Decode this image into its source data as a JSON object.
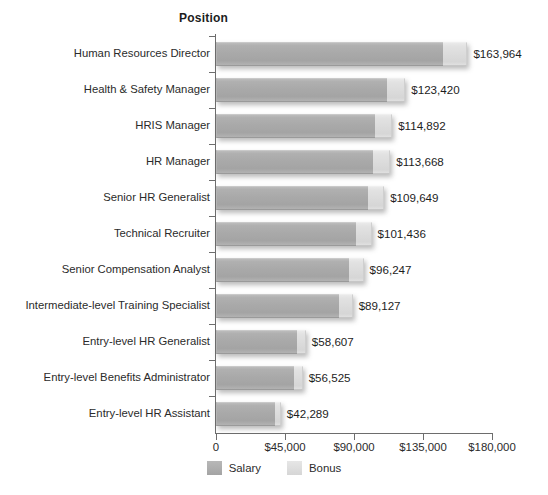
{
  "axis_title": "Position",
  "legend": {
    "position": "bottom",
    "entries": [
      {
        "label": "Salary",
        "color": "#a9a9a9",
        "swatch": "salary"
      },
      {
        "label": "Bonus",
        "color": "#dcdcdc",
        "swatch": "bonus"
      }
    ]
  },
  "x_axis": {
    "ticks": [
      {
        "label": "0",
        "value": 0
      },
      {
        "label": "$45,000",
        "value": 45000
      },
      {
        "label": "$90,000",
        "value": 90000
      },
      {
        "label": "$135,000",
        "value": 135000
      },
      {
        "label": "$180,000",
        "value": 180000
      }
    ],
    "min": 0,
    "max": 180000
  },
  "chart_data": {
    "type": "bar",
    "orientation": "horizontal",
    "stacked": true,
    "title": "",
    "subtitle": "",
    "xlabel": "",
    "ylabel": "Position",
    "xlim": [
      0,
      180000
    ],
    "grid": false,
    "legend_position": "bottom",
    "categories": [
      "Human Resources Director",
      "Health & Safety Manager",
      "HRIS Manager",
      "HR Manager",
      "Senior HR Generalist",
      "Technical Recruiter",
      "Senior Compensation Analyst",
      "Intermediate-level Training Specialist",
      "Entry-level HR Generalist",
      "Entry-level Benefits Administrator",
      "Entry-level HR Assistant"
    ],
    "series": [
      {
        "name": "Salary",
        "color": "#a9a9a9",
        "values": [
          148000,
          111500,
          103800,
          102700,
          99100,
          91600,
          86900,
          80500,
          52900,
          51000,
          38200
        ]
      },
      {
        "name": "Bonus",
        "color": "#dcdcdc",
        "values": [
          15964,
          11920,
          11092,
          10968,
          10549,
          9836,
          9347,
          8627,
          5707,
          5525,
          4089
        ]
      }
    ],
    "totals": [
      163964,
      123420,
      114892,
      113668,
      109649,
      101436,
      96247,
      89127,
      58607,
      56525,
      42289
    ],
    "data_labels": [
      "$163,964",
      "$123,420",
      "$114,892",
      "$113,668",
      "$109,649",
      "$101,436",
      "$96,247",
      "$89,127",
      "$58,607",
      "$56,525",
      "$42,289"
    ]
  }
}
